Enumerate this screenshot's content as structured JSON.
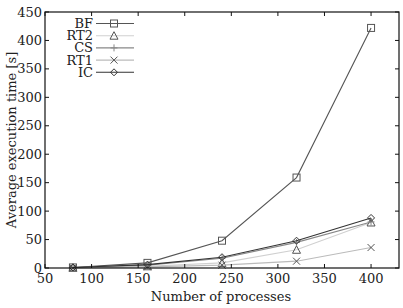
{
  "chart_data": {
    "type": "line",
    "title": "",
    "xlabel": "Number of processes",
    "ylabel": "Average execution time [s]",
    "xlim": [
      50,
      430
    ],
    "ylim": [
      0,
      450
    ],
    "xticks": [
      50,
      100,
      150,
      200,
      250,
      300,
      350,
      400
    ],
    "yticks": [
      0,
      50,
      100,
      150,
      200,
      250,
      300,
      350,
      400,
      450
    ],
    "grid": false,
    "legend_position": "upper-left",
    "x": [
      80,
      160,
      240,
      320,
      400
    ],
    "series": [
      {
        "name": "BF",
        "marker": "square",
        "color": "#555555",
        "values": [
          1,
          9,
          48,
          159,
          422
        ]
      },
      {
        "name": "RT2",
        "marker": "triangle",
        "color": "#d0d0d0",
        "values": [
          0.5,
          3,
          9,
          32,
          80
        ]
      },
      {
        "name": "CS",
        "marker": "plus",
        "color": "#888888",
        "values": [
          1,
          5,
          17,
          45,
          81
        ]
      },
      {
        "name": "RT1",
        "marker": "cross",
        "color": "#bbbbbb",
        "values": [
          0.3,
          2,
          5,
          12,
          36
        ]
      },
      {
        "name": "IC",
        "marker": "diamond",
        "color": "#333333",
        "values": [
          1,
          6,
          19,
          48,
          88
        ]
      }
    ]
  }
}
